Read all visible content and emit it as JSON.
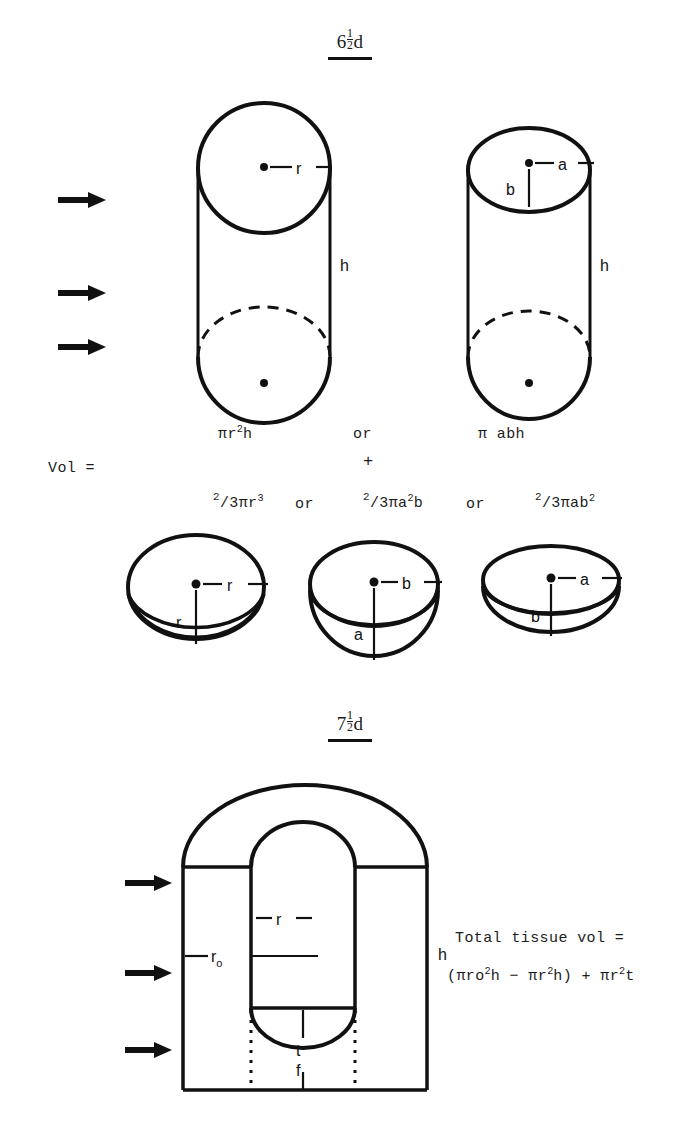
{
  "page": {
    "width": 699,
    "height": 1130,
    "background": "#ffffff",
    "ink_color": "#111111"
  },
  "sections": [
    {
      "id": "section-6-5d",
      "header_whole": "6",
      "header_num": "1",
      "header_den": "2",
      "header_suffix": "d",
      "header_full": "6 1/2 d"
    },
    {
      "id": "section-7-5d",
      "header_whole": "7",
      "header_num": "1",
      "header_den": "2",
      "header_suffix": "d",
      "header_full": "7 1/2 d"
    }
  ],
  "figure_top": {
    "caption": "Cylinder plus hemisphere volume models for two embryo stages",
    "cylinder_circular": {
      "name": "circular-cylinder",
      "radius_label": "r",
      "height_label": "h",
      "center_dot": true,
      "hidden_edge": "dashed"
    },
    "cylinder_elliptical": {
      "name": "elliptical-cylinder",
      "semi_axis_horizontal_label": "a",
      "semi_axis_vertical_label": "b",
      "height_label": "h",
      "center_dot": true,
      "hidden_edge": "dashed"
    },
    "arrow_markers_count": 3,
    "formula_row_1": {
      "term_1_base": "πr",
      "term_1_exp": "2",
      "term_1_tail": "h",
      "conjunction": "or",
      "term_2": "π abh"
    },
    "plus_sign": "+",
    "vol_label": "Vol =",
    "formula_row_2": {
      "term_1_num": "2",
      "term_1_den_pre": "/3πr",
      "term_1_exp": "3",
      "conjunction_1": "or",
      "term_2_num": "2",
      "term_2_den_pre": "/3πa",
      "term_2_exp": "2",
      "term_2_tail": "b",
      "conjunction_2": "or",
      "term_3_num": "2",
      "term_3_den_pre": "/3πab",
      "term_3_exp": "2"
    },
    "hemispheres": [
      {
        "name": "hemisphere-sphere",
        "horizontal_label": "r",
        "vertical_label": "r",
        "shape": "spherical"
      },
      {
        "name": "hemisphere-prolate",
        "horizontal_label": "b",
        "vertical_label": "a",
        "shape": "prolate"
      },
      {
        "name": "hemisphere-oblate",
        "horizontal_label": "a",
        "vertical_label": "b",
        "shape": "oblate"
      }
    ]
  },
  "figure_bottom": {
    "caption": "Hollow domed cylinder tissue volume model",
    "inner_radius_label": "r",
    "outer_radius_label": "r",
    "outer_radius_sub": "o",
    "height_label": "h",
    "thickness_label": "t",
    "floor_label": "f",
    "arrow_markers_count": 3,
    "dotted_guides": true,
    "total_label": "Total tissue vol =",
    "total_formula": {
      "open": "(πro",
      "exp_1": "2",
      "mid_1": "h  −  πr",
      "exp_2": "2",
      "mid_2": "h)  +  πr",
      "exp_3": "2",
      "tail": "t"
    }
  }
}
